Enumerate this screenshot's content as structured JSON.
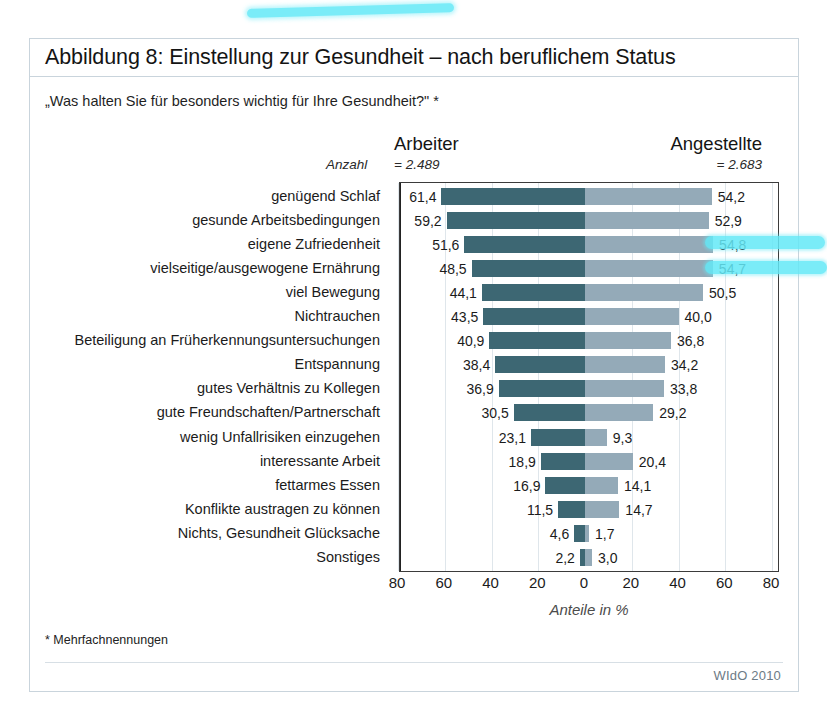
{
  "figure": {
    "title": "Abbildung 8: Einstellung zur Gesundheit – nach beruflichem Status",
    "question": "„Was halten Sie für besonders wichtig für Ihre Gesundheit?\" *",
    "anzahl_label": "Anzahl",
    "footnote": "* Mehrfachnennungen",
    "source": "WIdO 2010"
  },
  "colors": {
    "bar_left": "#3d6773",
    "bar_right": "#94aab8",
    "frame": "#c9d4dc",
    "axis": "#222222",
    "highlighter": "#63e9f7"
  },
  "chart_data": {
    "type": "bar",
    "orientation": "horizontal-diverging",
    "title": "Abbildung 8: Einstellung zur Gesundheit – nach beruflichem Status",
    "subtitle": "„Was halten Sie für besonders wichtig für Ihre Gesundheit?\" *",
    "xlabel": "Anteile in %",
    "ylabel": "",
    "xlim": [
      -80,
      80
    ],
    "xticks": [
      80,
      60,
      40,
      20,
      0,
      20,
      40,
      60,
      80
    ],
    "grid": true,
    "legend_position": "top",
    "categories": [
      "genügend Schlaf",
      "gesunde Arbeitsbedingungen",
      "eigene Zufriedenheit",
      "vielseitige/ausgewogene Ernährung",
      "viel Bewegung",
      "Nichtrauchen",
      "Beteiligung an Früherkennungsuntersuchungen",
      "Entspannung",
      "gutes Verhältnis zu Kollegen",
      "gute Freundschaften/Partnerschaft",
      "wenig Unfallrisiken einzugehen",
      "interessante Arbeit",
      "fettarmes Essen",
      "Konflikte austragen zu können",
      "Nichts, Gesundheit Glücksache",
      "Sonstiges"
    ],
    "series": [
      {
        "name": "Arbeiter",
        "count_label": "= 2.489",
        "side": "left",
        "color": "#3d6773",
        "values": [
          61.4,
          59.2,
          51.6,
          48.5,
          44.1,
          43.5,
          40.9,
          38.4,
          36.9,
          30.5,
          23.1,
          18.9,
          16.9,
          11.5,
          4.6,
          2.2
        ],
        "labels": [
          "61,4",
          "59,2",
          "51,6",
          "48,5",
          "44,1",
          "43,5",
          "40,9",
          "38,4",
          "36,9",
          "30,5",
          "23,1",
          "18,9",
          "16,9",
          "11,5",
          "4,6",
          "2,2"
        ]
      },
      {
        "name": "Angestellte",
        "count_label": "= 2.683",
        "side": "right",
        "color": "#94aab8",
        "values": [
          54.2,
          52.9,
          54.8,
          54.7,
          50.5,
          40.0,
          36.8,
          34.2,
          33.8,
          29.2,
          9.3,
          20.4,
          14.1,
          14.7,
          1.7,
          3.0
        ],
        "labels": [
          "54,2",
          "52,9",
          "54,8",
          "54,7",
          "50,5",
          "40,0",
          "36,8",
          "34,2",
          "33,8",
          "29,2",
          "9,3",
          "20,4",
          "14,1",
          "14,7",
          "1,7",
          "3,0"
        ]
      }
    ],
    "annotations": [
      {
        "type": "highlighter",
        "target": "title",
        "color": "#63e9f7"
      },
      {
        "type": "highlighter",
        "target": "eigene Zufriedenheit / 54,8",
        "color": "#63e9f7"
      },
      {
        "type": "highlighter",
        "target": "vielseitige/ausgewogene Ernährung / 54,7",
        "color": "#63e9f7"
      }
    ]
  }
}
